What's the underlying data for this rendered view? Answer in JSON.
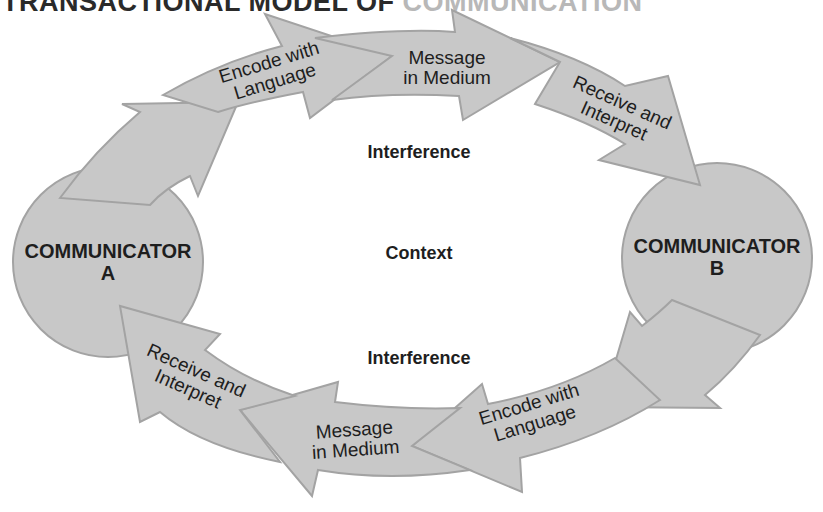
{
  "title": {
    "main": "TRANSACTIONAL MODEL OF ",
    "faded": "COMMUNICATION"
  },
  "communicators": {
    "a": {
      "line1": "COMMUNICATOR",
      "line2": "A"
    },
    "b": {
      "line1": "COMMUNICATOR",
      "line2": "B"
    }
  },
  "top_flow": [
    {
      "line1": "Encode with",
      "line2": "Language"
    },
    {
      "line1": "Message",
      "line2": "in Medium"
    },
    {
      "line1": "Receive and",
      "line2": "Interpret"
    }
  ],
  "bottom_flow": [
    {
      "line1": "Encode with",
      "line2": "Language"
    },
    {
      "line1": "Message",
      "line2": "in Medium"
    },
    {
      "line1": "Receive and",
      "line2": "Interpret"
    }
  ],
  "center": {
    "interference_top": "Interference",
    "context": "Context",
    "interference_bottom": "Interference"
  },
  "colors": {
    "fill": "#c8c8c8",
    "stroke": "#a3a3a3",
    "text": "#1e1e1e"
  }
}
